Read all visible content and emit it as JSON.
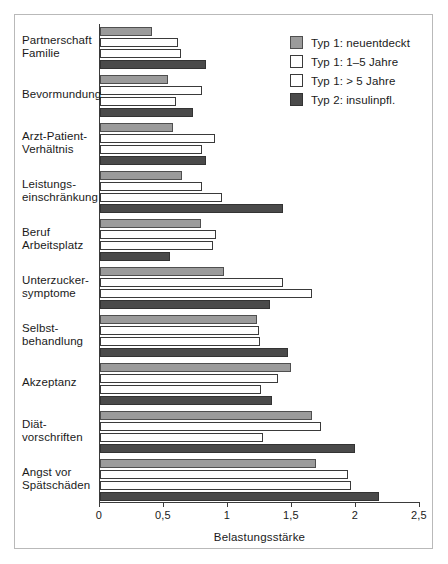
{
  "chart_data": {
    "type": "bar",
    "orientation": "horizontal",
    "title": "",
    "xlabel": "Belastungsstärke",
    "ylabel": "",
    "xlim": [
      0,
      2.5
    ],
    "xticks": [
      "0",
      "0,5",
      "1",
      "1,5",
      "2",
      "2,5"
    ],
    "xtick_values": [
      0,
      0.5,
      1,
      1.5,
      2,
      2.5
    ],
    "grid": false,
    "legend_position": "top-right",
    "categories": [
      "Partnerschaft\nFamilie",
      "Bevormundung",
      "Arzt-Patient-\nVerhältnis",
      "Leistungs-\neinschränkung",
      "Beruf\nArbeitsplatz",
      "Unterzucker-\nsymptome",
      "Selbst-\nbehandlung",
      "Akzeptanz",
      "Diät-\nvorschriften",
      "Angst vor\nSpätschäden"
    ],
    "category_lines": [
      [
        "Partnerschaft",
        "Familie"
      ],
      [
        "Bevormundung"
      ],
      [
        "Arzt-Patient-",
        "Verhältnis"
      ],
      [
        "Leistungs-",
        "einschränkung"
      ],
      [
        "Beruf",
        "Arbeitsplatz"
      ],
      [
        "Unterzucker-",
        "symptome"
      ],
      [
        "Selbst-",
        "behandlung"
      ],
      [
        "Akzeptanz"
      ],
      [
        "Diät-",
        "vorschriften"
      ],
      [
        "Angst vor",
        "Spätschäden"
      ]
    ],
    "series": [
      {
        "name": "Typ 1: neuentdeckt",
        "color": "#9b9b9b",
        "values": [
          0.41,
          0.53,
          0.57,
          0.64,
          0.79,
          0.97,
          1.23,
          1.49,
          1.66,
          1.69
        ]
      },
      {
        "name": "Typ 1: 1–5 Jahre",
        "color": "#ffffff",
        "values": [
          0.61,
          0.8,
          0.9,
          0.8,
          0.91,
          1.43,
          1.24,
          1.39,
          1.73,
          1.94
        ]
      },
      {
        "name": "Typ 1: > 5 Jahre",
        "color": "#ffffff",
        "values": [
          0.63,
          0.59,
          0.8,
          0.95,
          0.88,
          1.66,
          1.25,
          1.26,
          1.27,
          1.96
        ]
      },
      {
        "name": "Typ 2: insulinpfl.",
        "color": "#4a4a4a",
        "values": [
          0.83,
          0.73,
          0.83,
          1.43,
          0.55,
          1.33,
          1.47,
          1.34,
          1.99,
          2.18
        ]
      }
    ]
  },
  "legend": {
    "items": [
      {
        "label": "Typ 1: neuentdeckt",
        "swatch": "#9b9b9b"
      },
      {
        "label": "Typ 1: 1–5 Jahre",
        "swatch": "#ffffff"
      },
      {
        "label": "Typ 1: > 5 Jahre",
        "swatch": "#ffffff"
      },
      {
        "label": "Typ 2: insulinpfl.",
        "swatch": "#4a4a4a"
      }
    ]
  },
  "axis": {
    "xlabel": "Belastungsstärke"
  }
}
